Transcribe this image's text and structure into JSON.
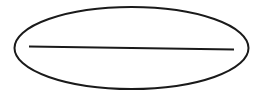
{
  "diagram": {
    "shape": "ellipse-with-horizontal-line",
    "colors": {
      "stroke": "#1a1a1a",
      "background": "#ffffff"
    },
    "ellipse": {
      "cx": 131.5,
      "cy": 48,
      "rx": 117,
      "ry": 41,
      "stroke_width": 2
    },
    "line": {
      "x1": 29,
      "y1": 46.5,
      "x2": 234,
      "y2": 49.5,
      "stroke_width": 2
    }
  }
}
